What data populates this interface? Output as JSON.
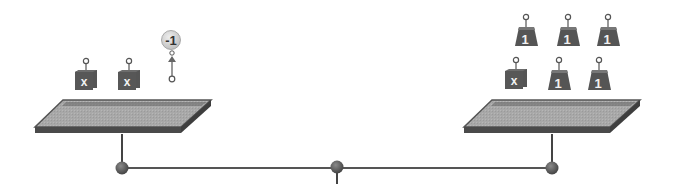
{
  "diagram": {
    "type": "balance-scale-equation",
    "colors": {
      "background": "#ffffff",
      "pan_top": "#a9a9a9",
      "pan_rim": "#5e5e5e",
      "pan_front": "#4a4a4a",
      "weight_body": "#555555",
      "weight_dark": "#3a3a3a",
      "weight_label": "#f2f2f2",
      "balloon_fill": "#cfcfcf",
      "balloon_label": "#333333",
      "beam": "#555555",
      "pivot": "#5a5a5a"
    },
    "left_pan": {
      "items": [
        {
          "kind": "variable-block",
          "label": "x"
        },
        {
          "kind": "variable-block",
          "label": "x"
        },
        {
          "kind": "balloon",
          "label": "-1"
        }
      ]
    },
    "right_pan": {
      "items": [
        {
          "kind": "unit-weight",
          "label": "1"
        },
        {
          "kind": "unit-weight",
          "label": "1"
        },
        {
          "kind": "unit-weight",
          "label": "1"
        },
        {
          "kind": "variable-block",
          "label": "x"
        },
        {
          "kind": "unit-weight",
          "label": "1"
        },
        {
          "kind": "unit-weight",
          "label": "1"
        }
      ]
    },
    "beam": {
      "pivots": [
        "left",
        "center",
        "right"
      ]
    }
  }
}
